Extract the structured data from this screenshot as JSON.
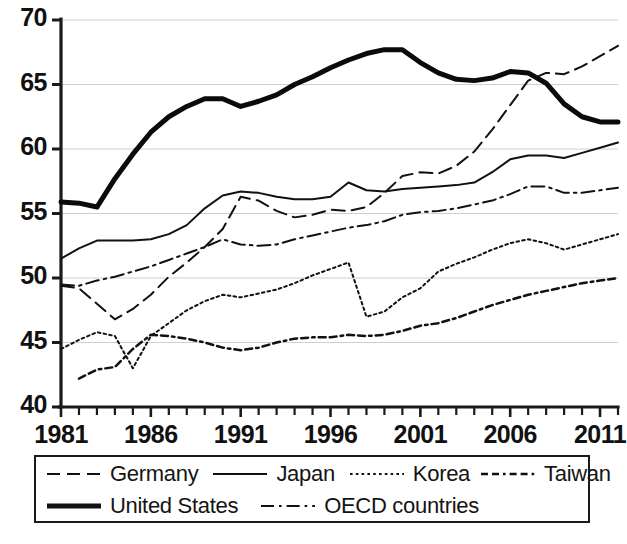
{
  "chart_data": {
    "type": "line",
    "title": "",
    "subtitle": "",
    "xlabel": "",
    "ylabel": "",
    "xlim": [
      1981,
      2012
    ],
    "ylim": [
      40,
      70
    ],
    "grid": true,
    "grid_axis": "y",
    "legend_position": "below-plot",
    "x_tick_labels": [
      "1981",
      "1986",
      "1991",
      "1996",
      "2001",
      "2006",
      "2011"
    ],
    "x_tick_values": [
      1981,
      1986,
      1991,
      1996,
      2001,
      2006,
      2011
    ],
    "x_minor_tick_step": 1,
    "y_tick_labels": [
      "40",
      "45",
      "50",
      "55",
      "60",
      "65",
      "70"
    ],
    "y_tick_values": [
      40,
      45,
      50,
      55,
      60,
      65,
      70
    ],
    "x": [
      1981,
      1982,
      1983,
      1984,
      1985,
      1986,
      1987,
      1988,
      1989,
      1990,
      1991,
      1992,
      1993,
      1994,
      1995,
      1996,
      1997,
      1998,
      1999,
      2000,
      2001,
      2002,
      2003,
      2004,
      2005,
      2006,
      2007,
      2008,
      2009,
      2010,
      2011,
      2012
    ],
    "series": [
      {
        "name": "Germany",
        "style": "dashed",
        "width": 2,
        "color": "#111111",
        "values": [
          49.4,
          49.2,
          48.0,
          46.8,
          47.6,
          48.7,
          50.1,
          51.2,
          52.4,
          53.8,
          56.3,
          56.0,
          55.2,
          54.7,
          54.9,
          55.3,
          55.2,
          55.5,
          56.6,
          57.9,
          58.2,
          58.1,
          58.7,
          59.8,
          61.5,
          63.4,
          65.3,
          65.9,
          65.8,
          66.4,
          67.2,
          68.0
        ]
      },
      {
        "name": "Japan",
        "style": "solid",
        "width": 2,
        "color": "#111111",
        "values": [
          51.5,
          52.3,
          52.9,
          52.9,
          52.9,
          53.0,
          53.4,
          54.1,
          55.4,
          56.4,
          56.7,
          56.6,
          56.3,
          56.1,
          56.1,
          56.3,
          57.4,
          56.8,
          56.7,
          56.9,
          57.0,
          57.1,
          57.2,
          57.4,
          58.2,
          59.2,
          59.5,
          59.5,
          59.3,
          59.7,
          60.1,
          60.5
        ]
      },
      {
        "name": "Korea",
        "style": "dotted",
        "width": 2,
        "color": "#111111",
        "values": [
          44.5,
          45.2,
          45.8,
          45.5,
          43.0,
          45.5,
          46.5,
          47.5,
          48.2,
          48.7,
          48.5,
          48.8,
          49.1,
          49.6,
          50.2,
          50.7,
          51.2,
          47.0,
          47.4,
          48.5,
          49.2,
          50.5,
          51.1,
          51.6,
          52.2,
          52.7,
          53.0,
          52.7,
          52.2,
          52.6,
          53.0,
          53.4
        ]
      },
      {
        "name": "Taiwan",
        "style": "dashdotdash",
        "width": 2.5,
        "color": "#111111",
        "values": [
          null,
          42.2,
          42.9,
          43.1,
          44.5,
          45.6,
          45.5,
          45.3,
          45.0,
          44.6,
          44.4,
          44.6,
          45.0,
          45.3,
          45.4,
          45.4,
          45.6,
          45.5,
          45.6,
          45.9,
          46.3,
          46.5,
          46.9,
          47.4,
          47.9,
          48.3,
          48.7,
          49.0,
          49.3,
          49.6,
          49.8,
          50.0
        ]
      },
      {
        "name": "United States",
        "style": "solid",
        "width": 5,
        "color": "#0b0b0b",
        "values": [
          55.9,
          55.8,
          55.5,
          57.7,
          59.6,
          61.3,
          62.5,
          63.3,
          63.9,
          63.9,
          63.3,
          63.7,
          64.2,
          65.0,
          65.6,
          66.3,
          66.9,
          67.4,
          67.7,
          67.7,
          66.7,
          65.9,
          65.4,
          65.3,
          65.5,
          66.0,
          65.9,
          65.1,
          63.5,
          62.5,
          62.1,
          62.1
        ]
      },
      {
        "name": "OECD countries",
        "style": "dashdot",
        "width": 2,
        "color": "#111111",
        "values": [
          49.5,
          49.4,
          49.8,
          50.1,
          50.5,
          50.9,
          51.4,
          51.9,
          52.4,
          53.0,
          52.6,
          52.5,
          52.6,
          53.0,
          53.3,
          53.6,
          53.9,
          54.1,
          54.4,
          54.9,
          55.1,
          55.2,
          55.4,
          55.7,
          56.0,
          56.5,
          57.1,
          57.1,
          56.6,
          56.6,
          56.8,
          57.0
        ]
      }
    ]
  },
  "legend": {
    "rows": [
      [
        {
          "label": "Germany",
          "style": "dashed"
        },
        {
          "label": "Japan",
          "style": "solid"
        },
        {
          "label": "Korea",
          "style": "dotted"
        },
        {
          "label": "Taiwan",
          "style": "dashdotdash"
        }
      ],
      [
        {
          "label": "United States",
          "style": "solid-thick"
        },
        {
          "label": "OECD countries",
          "style": "dashdot"
        }
      ]
    ]
  },
  "colors": {
    "line": "#111111",
    "grid": "#cfcfcf",
    "axis": "#1a1a1a",
    "background": "#ffffff"
  }
}
